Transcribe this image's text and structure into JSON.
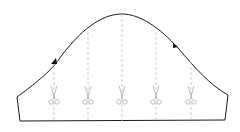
{
  "diagram": {
    "type": "sewing-pattern",
    "outline_color": "#1a1a1a",
    "slash_line_color": "#c8c8c8",
    "scissors_color": "#b4b4b4",
    "notch_color": "#111111",
    "slash_lines": [
      {
        "id": "slash-1",
        "x": 54,
        "top": 62
      },
      {
        "id": "slash-2",
        "x": 88,
        "top": 32
      },
      {
        "id": "slash-3",
        "x": 122,
        "top": 14
      },
      {
        "id": "slash-4",
        "x": 156,
        "top": 32
      },
      {
        "id": "slash-5",
        "x": 191,
        "top": 62
      }
    ],
    "notches": [
      {
        "id": "front-notch",
        "side": "left"
      },
      {
        "id": "back-notch",
        "side": "right"
      }
    ]
  }
}
